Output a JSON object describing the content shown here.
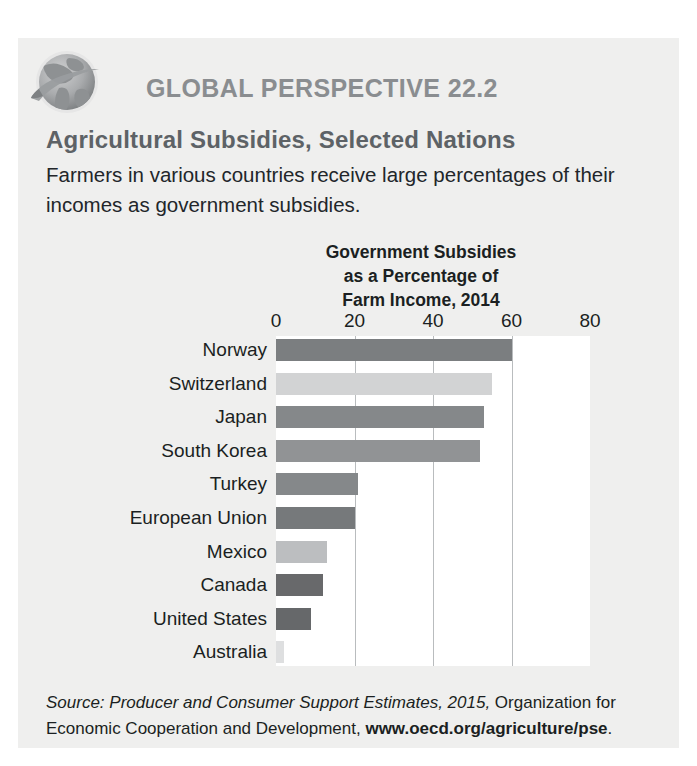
{
  "header": {
    "icon": "globe-icon",
    "kicker": "GLOBAL PERSPECTIVE 22.2",
    "subtitle": "Agricultural Subsidies, Selected Nations",
    "lede": "Farmers in various countries receive large percentages of their incomes as government subsidies."
  },
  "source": {
    "label_italic": "Source: Producer and Consumer Support Estimates, 2015,",
    "rest": " Organization for Economic Cooperation and Development, ",
    "url": "www.oecd.org/agriculture/pse",
    "period": "."
  },
  "colors": {
    "card_background": "#efefee",
    "plot_background": "#ffffff",
    "gridline": "#b9bcbe",
    "kicker": "#8a8d90",
    "subtitle": "#5d6266",
    "text": "#1b1f22"
  },
  "chart_data": {
    "type": "bar",
    "orientation": "horizontal",
    "title": "Government Subsidies as a Percentage of Farm Income, 2014",
    "title_lines": [
      "Government Subsidies",
      "as a Percentage of",
      "Farm Income, 2014"
    ],
    "xlabel": "",
    "ylabel": "",
    "xlim": [
      0,
      80
    ],
    "ticks": [
      0,
      20,
      40,
      60,
      80
    ],
    "tick_labels": [
      "0",
      "20",
      "40",
      "60",
      "80"
    ],
    "grid": true,
    "legend": "none",
    "categories": [
      "Norway",
      "Switzerland",
      "Japan",
      "South Korea",
      "Turkey",
      "European Union",
      "Mexico",
      "Canada",
      "United States",
      "Australia"
    ],
    "values": [
      60,
      55,
      53,
      52,
      21,
      20,
      13,
      12,
      9,
      2
    ],
    "bar_colors": [
      "#7b7e80",
      "#d2d3d4",
      "#85888a",
      "#919395",
      "#85888a",
      "#76797b",
      "#bcbec0",
      "#68696b",
      "#66686a",
      "#dedfe0"
    ]
  }
}
